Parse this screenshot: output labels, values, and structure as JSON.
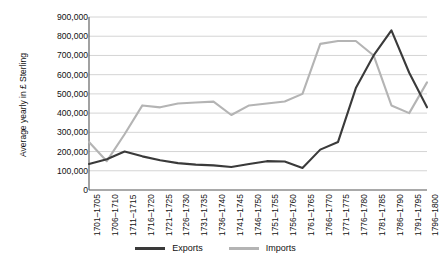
{
  "chart_data": {
    "type": "line",
    "title": "",
    "xlabel": "",
    "ylabel": "Average yearly in £ Sterling",
    "ylim": [
      0,
      900000
    ],
    "ytick_step": 100000,
    "grid": true,
    "legend_position": "bottom",
    "categories": [
      "1701–1705",
      "1706–1710",
      "1711–1715",
      "1716–1720",
      "1721–1725",
      "1726–1730",
      "1731–1735",
      "1736–1740",
      "1741–1745",
      "1746–1750",
      "1751–1755",
      "1756–1760",
      "1761–1765",
      "1766–1770",
      "1771–1775",
      "1776–1780",
      "1781–1785",
      "1786–1790",
      "1791–1795",
      "1796–1800"
    ],
    "ytick_labels": [
      "900,000",
      "800,000",
      "700,000",
      "600,000",
      "500,000",
      "400,000",
      "300,000",
      "200,000",
      "100,000",
      "0"
    ],
    "series": [
      {
        "name": "Exports",
        "color": "#3a3a3a",
        "values": [
          135000,
          160000,
          200000,
          175000,
          155000,
          140000,
          132000,
          128000,
          120000,
          135000,
          150000,
          148000,
          115000,
          210000,
          250000,
          530000,
          700000,
          830000,
          610000,
          430000
        ]
      },
      {
        "name": "Imports",
        "color": "#b4b4b4",
        "values": [
          250000,
          150000,
          290000,
          440000,
          430000,
          450000,
          455000,
          460000,
          390000,
          440000,
          450000,
          460000,
          500000,
          760000,
          775000,
          775000,
          700000,
          440000,
          400000,
          560000
        ]
      }
    ],
    "series_tail": {
      "Exports": [
        780000,
        400000
      ],
      "Imports": [
        740000,
        215000
      ]
    },
    "legend": [
      {
        "label": "Exports",
        "color": "#3a3a3a"
      },
      {
        "label": "Imports",
        "color": "#b4b4b4"
      }
    ]
  },
  "axis": {
    "y_title": "Average yearly in £ Sterling"
  }
}
